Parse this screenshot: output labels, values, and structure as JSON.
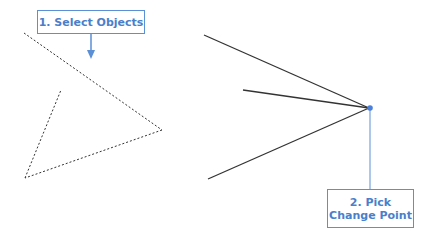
{
  "callouts": {
    "step1": {
      "label": "1. Select Objects"
    },
    "step2": {
      "line1": "2. Pick",
      "line2": "Change Point"
    }
  },
  "colors": {
    "accent": "#5b8fd6",
    "dashed_line": "#333333",
    "solid_line": "#333333"
  }
}
